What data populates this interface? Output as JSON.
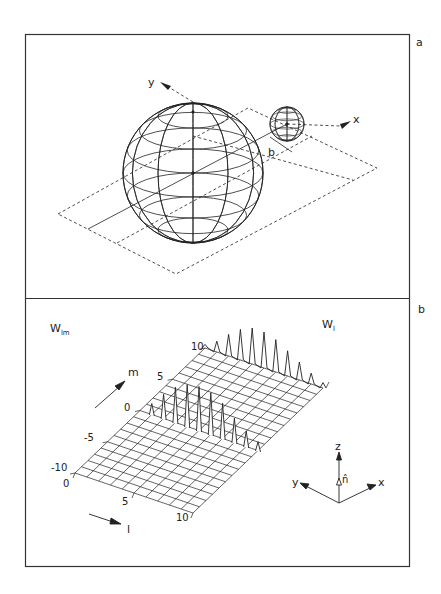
{
  "figure": {
    "panels": [
      {
        "id": "a",
        "label": "a",
        "description": "Two spheres with a dashed plane, impact parameter b",
        "axes": {
          "x_label": "x",
          "y_label": "y"
        },
        "impact_parameter_label": "b"
      },
      {
        "id": "b",
        "label": "b",
        "surface_label": "W",
        "surface_label_sub": "lm",
        "projection_label": "W",
        "projection_label_sub": "l",
        "l_axis": {
          "label": "l",
          "ticks": [
            "0",
            "5",
            "10"
          ]
        },
        "m_axis": {
          "label": "m",
          "ticks": [
            "-10",
            "-5",
            "0",
            "5",
            "10"
          ]
        },
        "orientation": {
          "z": "z",
          "y": "y",
          "x": "x",
          "normal": "n̂"
        }
      }
    ]
  },
  "chart_data": {
    "type": "surface",
    "title": "",
    "xlabel": "l",
    "ylabel": "m",
    "zlabel": "W_lm",
    "l_range": [
      0,
      10
    ],
    "m_range": [
      -10,
      10
    ],
    "grid": true,
    "surface_peaks_m_eq_0": {
      "l": [
        0,
        1,
        2,
        3,
        4,
        5,
        6,
        7,
        8,
        9,
        10
      ],
      "height_rel": [
        0.0,
        0.25,
        0.55,
        0.8,
        0.95,
        1.0,
        0.95,
        0.8,
        0.55,
        0.35,
        0.2
      ]
    },
    "projection_W_l_at_m_10": {
      "l": [
        0,
        1,
        2,
        3,
        4,
        5,
        6,
        7,
        8,
        9,
        10
      ],
      "height_rel": [
        0.1,
        0.3,
        0.6,
        0.85,
        1.0,
        1.0,
        0.9,
        0.7,
        0.5,
        0.3,
        0.15
      ]
    }
  }
}
